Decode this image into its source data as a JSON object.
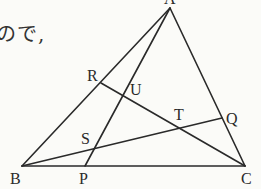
{
  "text_fragment": "ので,",
  "diagram": {
    "points": {
      "A": {
        "label": "A",
        "x": 170,
        "y": 8
      },
      "B": {
        "label": "B",
        "x": 22,
        "y": 166
      },
      "C": {
        "label": "C",
        "x": 245,
        "y": 166
      },
      "P": {
        "label": "P",
        "x": 85,
        "y": 166
      },
      "Q": {
        "label": "Q",
        "x": 222,
        "y": 118
      },
      "R": {
        "label": "R",
        "x": 101,
        "y": 83
      },
      "S": {
        "label": "S",
        "x": 93,
        "y": 149
      },
      "T": {
        "label": "T",
        "x": 180,
        "y": 126
      },
      "U": {
        "label": "U",
        "x": 124,
        "y": 96
      }
    },
    "segments": [
      [
        "A",
        "B"
      ],
      [
        "A",
        "C"
      ],
      [
        "B",
        "C"
      ],
      [
        "A",
        "P"
      ],
      [
        "B",
        "Q"
      ],
      [
        "R",
        "C"
      ]
    ]
  }
}
